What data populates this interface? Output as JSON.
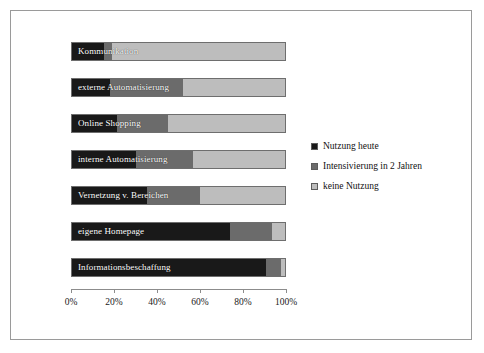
{
  "chart_data": {
    "type": "bar",
    "orientation": "horizontal",
    "stacked": true,
    "normalized_percent": true,
    "title": "",
    "subtitle": "",
    "xlabel": "",
    "ylabel": "",
    "xlim": [
      0,
      100
    ],
    "grid": false,
    "legend_position": "right",
    "tick_labels": [
      "0%",
      "20%",
      "40%",
      "60%",
      "80%",
      "100%"
    ],
    "tick_values": [
      0,
      20,
      40,
      60,
      80,
      100
    ],
    "categories": [
      "Kommunikation",
      "externe Automatisierung",
      "Online Shopping",
      "interne Automatisierung",
      "Vernetzung v. Bereichen",
      "eigene Homepage",
      "Informationsbeschaffung"
    ],
    "series": [
      {
        "name": "Nutzung heute",
        "color": "#191919",
        "values": [
          15,
          18,
          21,
          30,
          35,
          74,
          91
        ]
      },
      {
        "name": "Intensivierung in 2 Jahren",
        "color": "#6b6b6b",
        "values": [
          4,
          34,
          24,
          27,
          25,
          20,
          7
        ]
      },
      {
        "name": "keine Nutzung",
        "color": "#bdbdbd",
        "values": [
          81,
          48,
          55,
          43,
          40,
          6,
          2
        ]
      }
    ]
  },
  "legend": {
    "items": [
      {
        "label": "Nutzung heute",
        "color": "#191919"
      },
      {
        "label": "Intensivierung in 2 Jahren",
        "color": "#6b6b6b"
      },
      {
        "label": "keine Nutzung",
        "color": "#bdbdbd"
      }
    ]
  }
}
